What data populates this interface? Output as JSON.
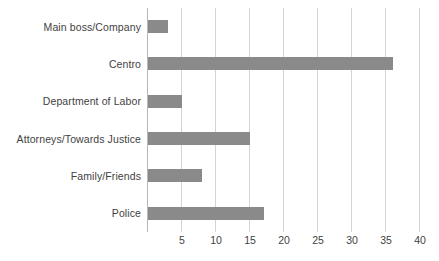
{
  "chart_data": {
    "type": "bar",
    "orientation": "horizontal",
    "title": "",
    "xlabel": "",
    "ylabel": "",
    "categories": [
      "Main boss/Company",
      "Centro",
      "Department of Labor",
      "Attorneys/Towards Justice",
      "Family/Friends",
      "Police"
    ],
    "values": [
      3,
      36,
      5,
      15,
      8,
      17
    ],
    "xlim": [
      0,
      40
    ],
    "xticks": [
      5,
      10,
      15,
      20,
      25,
      30,
      35,
      40
    ],
    "xtick_labels": [
      "5",
      "10",
      "15",
      "20",
      "25",
      "30",
      "35",
      "40"
    ],
    "grid": "vertical",
    "legend": "none",
    "bar_color": "#8a8a8a",
    "gridline_color": "#d4d4d4",
    "text_color": "#3f3f3f",
    "background_color": "#ffffff"
  }
}
